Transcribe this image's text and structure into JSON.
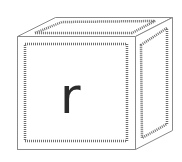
{
  "image": {
    "subject": "toy letter block",
    "letter": "r",
    "colors": {
      "background": "#ffffff",
      "outline": "#8a8a8a",
      "dashed_border": "#6e6e6e",
      "letter": "#2b2b2b"
    }
  }
}
